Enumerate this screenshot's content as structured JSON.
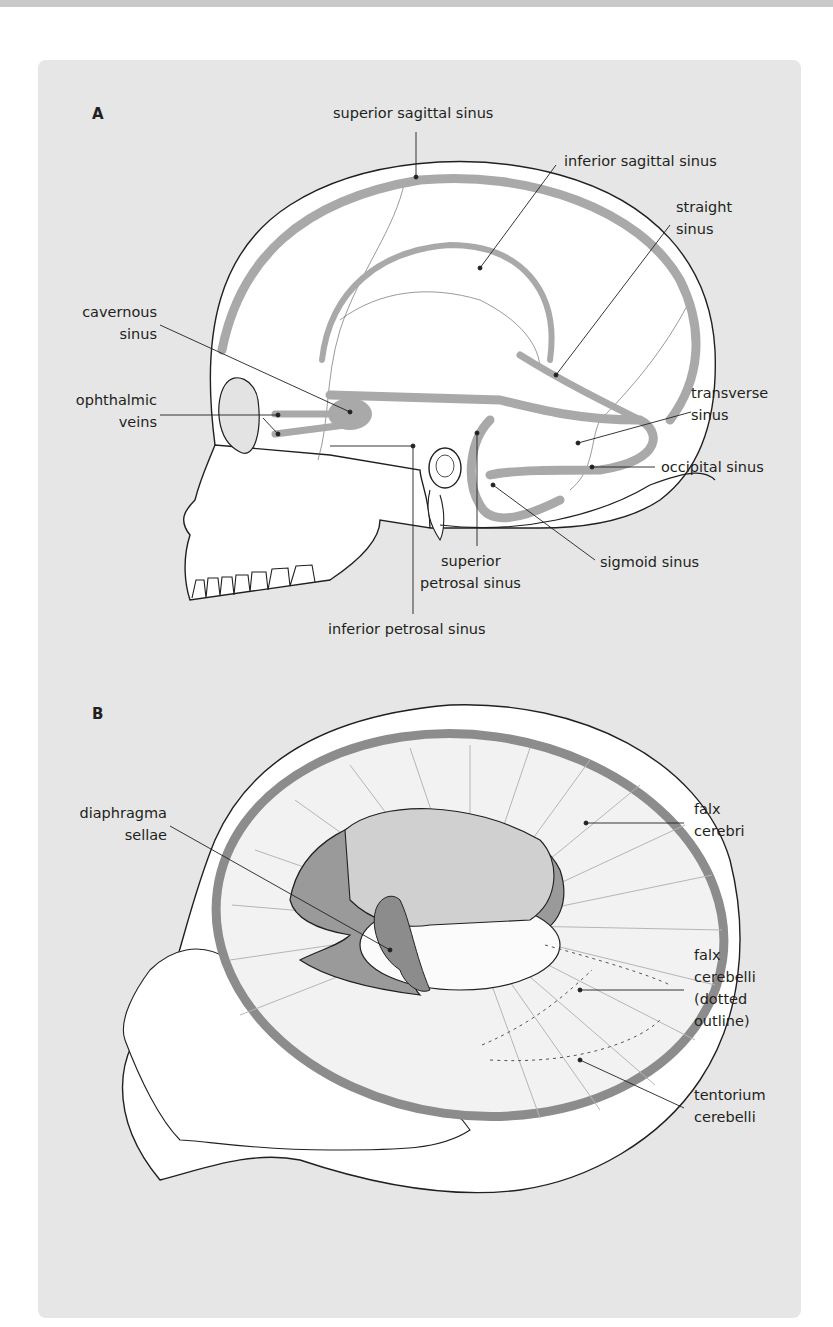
{
  "figure": {
    "panel_a": {
      "letter": "A",
      "labels": {
        "superior_sagittal_sinus": "superior sagittal sinus",
        "inferior_sagittal_sinus": "inferior sagittal sinus",
        "straight_sinus_1": "straight",
        "straight_sinus_2": "sinus",
        "cavernous_sinus_1": "cavernous",
        "cavernous_sinus_2": "sinus",
        "ophthalmic_veins_1": "ophthalmic",
        "ophthalmic_veins_2": "veins",
        "transverse_sinus_1": "transverse",
        "transverse_sinus_2": "sinus",
        "occipital_sinus": "occipital sinus",
        "sigmoid_sinus": "sigmoid sinus",
        "superior_petrosal_sinus_1": "superior",
        "superior_petrosal_sinus_2": "petrosal sinus",
        "inferior_petrosal_sinus": "inferior petrosal sinus"
      }
    },
    "panel_b": {
      "letter": "B",
      "labels": {
        "diaphragma_sellae_1": "diaphragma",
        "diaphragma_sellae_2": "sellae",
        "falx_cerebri_1": "falx",
        "falx_cerebri_2": "cerebri",
        "falx_cerebelli_1": "falx",
        "falx_cerebelli_2": "cerebelli",
        "falx_cerebelli_3": "(dotted",
        "falx_cerebelli_4": "outline)",
        "tentorium_cerebelli_1": "tentorium",
        "tentorium_cerebelli_2": "cerebelli"
      }
    },
    "colors": {
      "panel_bg": "#e6e6e6",
      "sinus_gray": "#a9a9a9",
      "dura_dark": "#8c8c8c",
      "line": "#231f20"
    }
  }
}
